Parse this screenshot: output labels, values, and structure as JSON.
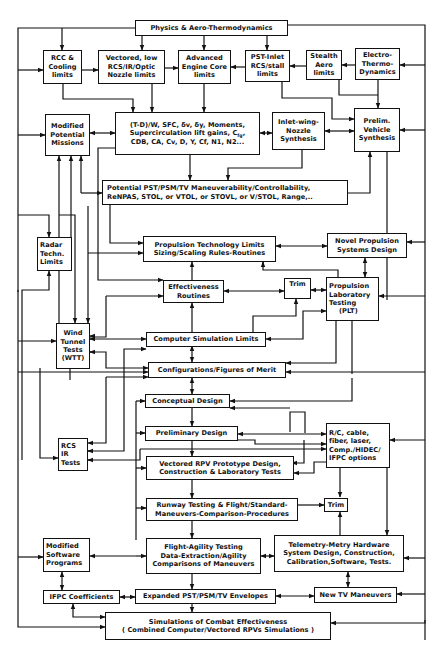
{
  "diagram": {
    "title": "Physics & Aero-Thermodynamics",
    "line_color": "#111111",
    "background": "#ffffff",
    "boxes": {
      "physics": [
        "Physics  &  Aero-Thermodynamics"
      ],
      "rcc": [
        "RCC  &",
        "Cooling",
        "limits"
      ],
      "vectored_low": [
        "Vectored, low",
        "RCS/IR/Optic",
        "Nozzle limits"
      ],
      "adv_engine": [
        "Advanced",
        "Engine Core",
        "limits"
      ],
      "pst_inlet": [
        "PST-Inlet",
        "RCS/stall",
        "limits"
      ],
      "stealth": [
        "Stealth",
        "Aero",
        "limits"
      ],
      "electro": [
        "Electro-",
        "Thermo-",
        "Dynamics"
      ],
      "modified_missions": [
        "Modified",
        "Potential",
        "Missions"
      ],
      "params": {
        "line1": "(T-D)/W, SFC, δv, δy, Moments,",
        "line2_pre": "Supercirculation lift gains, C",
        "line2_sub": "fg",
        "line2_post": ",",
        "line3": "CDB, CA, Cv, D, Y, Cf, N1, N2..."
      },
      "inlet_wing": [
        "Inlet-wing-",
        "Nozzle",
        "Synthesis"
      ],
      "prelim_vehicle": [
        "Prelim.",
        "Vehicle",
        "Synthesis"
      ],
      "potential": [
        "Potential PST/PSM/TV Maneuverability/Controllability,",
        "ReNPAS, STOL, or VTOL, or STOVL, or V/STOL, Range,.."
      ],
      "radar": [
        "Radar",
        "Techn.",
        "Limits"
      ],
      "prop_tech": [
        "Propulsion Technology Limits",
        "Sizing/Scaling Rules-Routines"
      ],
      "novel": [
        "Novel Propulsion",
        "Systems  Design"
      ],
      "effectiveness": [
        "Effectiveness",
        "Routines"
      ],
      "trim1": [
        "Trim"
      ],
      "plt": [
        "Propulsion",
        "Laboratory",
        "Testing",
        "(PLT)"
      ],
      "wtt": [
        "Wind",
        "Tunnel",
        "Tests",
        "(WTT)"
      ],
      "computer_sim": [
        "Computer Simulation Limits"
      ],
      "configurations": [
        "Configurations/Figures of Merit"
      ],
      "conceptual": [
        "Conceptual  Design"
      ],
      "preliminary": [
        "Preliminary Design"
      ],
      "rcs_ir": [
        "RCS",
        "IR",
        "Tests"
      ],
      "vectored_rpv": [
        "Vectored  RPV  Prototype Design,",
        "Construction & Laboratory Tests"
      ],
      "rc_cable": [
        "R/C, cable,",
        "fiber, laser,",
        "Comp./HIDEC/",
        "IFPC options"
      ],
      "runway": [
        "Runway Testing & Flight/Standard-",
        "Maneuvers-Comparison-Procedures"
      ],
      "trim2": [
        "Trim"
      ],
      "flight_agility": [
        "Flight-Agility Testing",
        "Data-Extraction/Agility",
        "Comparisons of Maneuvers"
      ],
      "telemetry": [
        "Telemetry-Metry Hardware",
        "System Design, Construction,",
        "Calibration,Software, Tests."
      ],
      "modified_software": [
        "Modified",
        "Software",
        "Programs"
      ],
      "ifpc": [
        "IFPC Coefficients"
      ],
      "expanded": [
        "Expanded PST/PSM/TV Envelopes"
      ],
      "new_tv": [
        "New TV Maneuvers"
      ],
      "simulations": [
        "Simulations of Combat Effectiveness",
        "( Combined Computer/Vectored RPVs Simulations )"
      ]
    }
  }
}
